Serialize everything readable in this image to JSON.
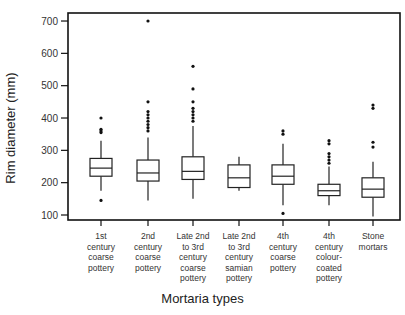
{
  "chart_data": {
    "type": "box",
    "title": "",
    "xlabel": "Mortaria types",
    "ylabel": "Rim diameter (mm)",
    "ylim": [
      85,
      735
    ],
    "yticks": [
      100,
      200,
      300,
      400,
      500,
      600,
      700
    ],
    "grid": false,
    "legend": null,
    "categories": [
      "1st century coarse pottery",
      "2nd century coarse pottery",
      "Late 2nd to 3rd century coarse pottery",
      "Late 2nd to 3rd century samian pottery",
      "4th century coarse pottery",
      "4th century colour-coated pottery",
      "Stone mortars"
    ],
    "category_lines": [
      [
        "1st",
        "century",
        "coarse",
        "pottery"
      ],
      [
        "2nd",
        "century",
        "coarse",
        "pottery"
      ],
      [
        "Late 2nd",
        "to 3rd",
        "century",
        "coarse",
        "pottery"
      ],
      [
        "Late 2nd",
        "to 3rd",
        "century",
        "samian",
        "pottery"
      ],
      [
        "4th",
        "century",
        "coarse",
        "pottery"
      ],
      [
        "4th",
        "century",
        "colour-",
        "coated",
        "pottery"
      ],
      [
        "Stone",
        "mortars"
      ]
    ],
    "boxes": [
      {
        "whisker_low": 175,
        "q1": 220,
        "median": 245,
        "q3": 275,
        "whisker_high": 330,
        "outliers": [
          145,
          355,
          360,
          365,
          400
        ]
      },
      {
        "whisker_low": 145,
        "q1": 205,
        "median": 230,
        "q3": 270,
        "whisker_high": 340,
        "outliers": [
          360,
          370,
          380,
          390,
          400,
          410,
          420,
          450,
          700
        ]
      },
      {
        "whisker_low": 150,
        "q1": 210,
        "median": 235,
        "q3": 280,
        "whisker_high": 375,
        "outliers": [
          390,
          400,
          410,
          420,
          430,
          450,
          490,
          560
        ]
      },
      {
        "whisker_low": 175,
        "q1": 185,
        "median": 215,
        "q3": 255,
        "whisker_high": 280,
        "outliers": []
      },
      {
        "whisker_low": 130,
        "q1": 195,
        "median": 220,
        "q3": 255,
        "whisker_high": 320,
        "outliers": [
          105,
          350,
          360
        ]
      },
      {
        "whisker_low": 130,
        "q1": 160,
        "median": 175,
        "q3": 195,
        "whisker_high": 250,
        "outliers": [
          260,
          270,
          280,
          290,
          320,
          330
        ]
      },
      {
        "whisker_low": 95,
        "q1": 155,
        "median": 180,
        "q3": 215,
        "whisker_high": 265,
        "outliers": [
          310,
          325,
          430,
          440
        ]
      }
    ]
  },
  "labels": {
    "ylabel": "Rim diameter (mm)",
    "xlabel": "Mortaria types"
  }
}
